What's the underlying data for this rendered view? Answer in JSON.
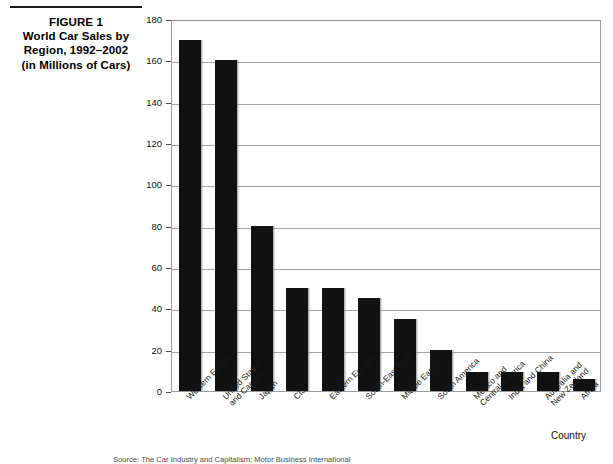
{
  "figure": {
    "label": "FIGURE 1",
    "title_line1": "World Car Sales by",
    "title_line2": "Region, 1992–2002",
    "title_line3": "(in Millions of Cars)"
  },
  "axis": {
    "x_title": "Country",
    "y_ticks": [
      "0",
      "20",
      "40",
      "60",
      "80",
      "100",
      "120",
      "140",
      "160",
      "180"
    ]
  },
  "footnote": {
    "text": "Source: The Car Industry and Capitalism; Motor Business International"
  },
  "chart_data": {
    "type": "bar",
    "title": "World Car Sales by Region, 1992–2002 (in Millions of Cars)",
    "xlabel": "Country",
    "ylabel": "",
    "ylim": [
      0,
      180
    ],
    "ytick_step": 20,
    "grid": true,
    "legend": false,
    "bar_color": "#111111",
    "categories": [
      "Western Europe",
      "United States and Canada",
      "Japan",
      "CIS",
      "Eastern Europe",
      "South-East Asia",
      "Middle East",
      "South America",
      "Mexico and Central America",
      "India and China",
      "Australia and New Zealand",
      "Africa"
    ],
    "category_lines": [
      [
        "Western Europe"
      ],
      [
        "United States",
        "and Canada"
      ],
      [
        "Japan"
      ],
      [
        "CIS"
      ],
      [
        "Eastern Europe"
      ],
      [
        "South-East Asia"
      ],
      [
        "Middle East"
      ],
      [
        "South America"
      ],
      [
        "Mexico and",
        "Central America"
      ],
      [
        "India and China"
      ],
      [
        "Australia and",
        "New Zealand"
      ],
      [
        "Africa"
      ]
    ],
    "values": [
      170,
      160,
      80,
      50,
      50,
      45,
      35,
      20,
      9,
      9,
      9,
      6
    ]
  }
}
